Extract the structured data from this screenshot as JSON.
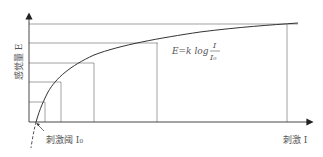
{
  "diagram": {
    "y_axis_label": "感觉量 E",
    "x_axis_label": "刺激 I",
    "threshold_label": "刺激阈 I₀",
    "formula": {
      "lhs": "E=k log",
      "numerator": "I",
      "denominator": "I₀"
    },
    "colors": {
      "axis": "#333333",
      "grid": "#8a8a8a",
      "curve": "#333333",
      "text": "#555555"
    }
  }
}
